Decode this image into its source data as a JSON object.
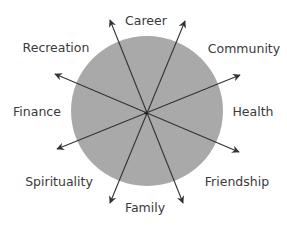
{
  "diagram": {
    "type": "wheel-of-life",
    "circle_fill": "#a9a9a9",
    "arrow_color": "#333333",
    "label_color": "#3a3a3a",
    "labels": {
      "career": "Career",
      "community": "Community",
      "health": "Health",
      "friendship": "Friendship",
      "family": "Family",
      "spirituality": "Spirituality",
      "finance": "Finance",
      "recreation": "Recreation"
    }
  }
}
